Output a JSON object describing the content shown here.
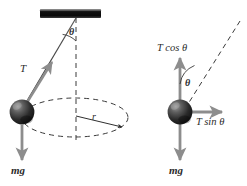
{
  "figure": {
    "colors": {
      "stroke": "#3a3a3a",
      "arrow_gray": "#8d8d8d",
      "ball_dark": "#1a1a1a",
      "ball_mid": "#4a4a4a",
      "ball_light": "#9a9a9a",
      "ceiling": "#101010",
      "dash": "#3a3a3a",
      "text": "#2b2b2b",
      "background": "#ffffff"
    }
  },
  "left_panel": {
    "name": "conical-pendulum-motion-diagram",
    "ceiling": {
      "label": "ceiling-support"
    },
    "labels": {
      "tension": "T",
      "angle": "θ",
      "radius": "r",
      "weight": "mg"
    }
  },
  "right_panel": {
    "name": "free-body-force-diagram",
    "labels": {
      "vertical_component": "T cos θ",
      "horizontal_component": "T sin θ",
      "angle": "θ",
      "weight": "mg"
    }
  }
}
